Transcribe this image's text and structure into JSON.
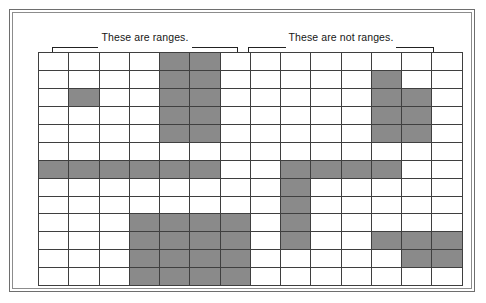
{
  "figure": {
    "colors": {
      "filled_cell": "#8a8a8a",
      "empty_cell": "#ffffff",
      "grid_line": "#3f3f3f",
      "frame": "#6e6e6e",
      "text": "#161616"
    }
  },
  "brackets": [
    {
      "id": "left",
      "caption": "These are ranges."
    },
    {
      "id": "right",
      "caption": "These are not ranges."
    }
  ],
  "grid": {
    "columns": 14,
    "rows": 13,
    "legend": {
      "filled": "selected / shaded cell",
      "empty": "unshaded cell"
    },
    "cells": [
      [
        0,
        0,
        0,
        0,
        1,
        1,
        0,
        0,
        0,
        0,
        0,
        0,
        0,
        0
      ],
      [
        0,
        0,
        0,
        0,
        1,
        1,
        0,
        0,
        0,
        0,
        0,
        1,
        0,
        0
      ],
      [
        0,
        1,
        0,
        0,
        1,
        1,
        0,
        0,
        0,
        0,
        0,
        1,
        1,
        0
      ],
      [
        0,
        0,
        0,
        0,
        1,
        1,
        0,
        0,
        0,
        0,
        0,
        1,
        1,
        0
      ],
      [
        0,
        0,
        0,
        0,
        1,
        1,
        0,
        0,
        0,
        0,
        0,
        1,
        1,
        0
      ],
      [
        0,
        0,
        0,
        0,
        0,
        0,
        0,
        0,
        0,
        0,
        0,
        0,
        0,
        0
      ],
      [
        1,
        1,
        1,
        1,
        1,
        1,
        0,
        0,
        1,
        1,
        1,
        1,
        0,
        0
      ],
      [
        0,
        0,
        0,
        0,
        0,
        0,
        0,
        0,
        1,
        0,
        0,
        0,
        0,
        0
      ],
      [
        0,
        0,
        0,
        0,
        0,
        0,
        0,
        0,
        1,
        0,
        0,
        0,
        0,
        0
      ],
      [
        0,
        0,
        0,
        1,
        1,
        1,
        1,
        0,
        1,
        0,
        0,
        0,
        0,
        0
      ],
      [
        0,
        0,
        0,
        1,
        1,
        1,
        1,
        0,
        1,
        0,
        0,
        1,
        1,
        1
      ],
      [
        0,
        0,
        0,
        1,
        1,
        1,
        1,
        0,
        0,
        0,
        0,
        0,
        1,
        1
      ],
      [
        0,
        0,
        0,
        1,
        1,
        1,
        1,
        0,
        0,
        0,
        0,
        0,
        0,
        0
      ]
    ]
  }
}
